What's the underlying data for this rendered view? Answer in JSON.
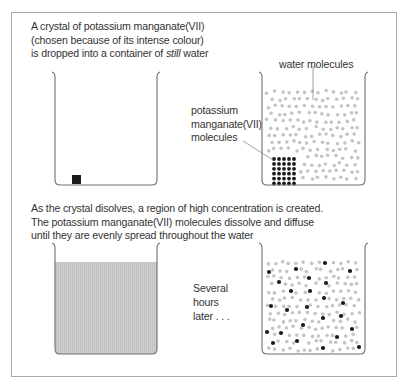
{
  "caption_top": {
    "line1": "A crystal of potassium manganate(VII)",
    "line2": "(chosen because of its intense colour)",
    "line3_pre": "is dropped into a container of ",
    "line3_em": "still",
    "line3_post": " water"
  },
  "labels": {
    "water_molecules": "water molecules",
    "kmno4_line1": "potassium",
    "kmno4_line2": "manganate(VII)",
    "kmno4_line3": "molecules"
  },
  "caption_bottom": {
    "line1": "As the crystal disolves, a region of high concentration is created.",
    "line2": "The potassium manganate(VII) molecules dissolve and diffuse",
    "line3": "until they are evenly spread throughout the water"
  },
  "time_note": {
    "line1": "Several",
    "line2": "hours",
    "line3": "later . . ."
  },
  "colors": {
    "frame": "#a8a8a8",
    "beaker": "#6e6e6e",
    "water_molecule": "#c4c4c4",
    "kmno4_molecule": "#1a1a1a",
    "dissolved_fill": "#c9c9c9"
  },
  "diffused_kmno4_positions": [
    [
      269,
      272
    ],
    [
      296,
      269
    ],
    [
      325,
      263
    ],
    [
      350,
      271
    ],
    [
      279,
      282
    ],
    [
      309,
      278
    ],
    [
      326,
      283
    ],
    [
      291,
      291
    ],
    [
      310,
      291
    ],
    [
      324,
      298
    ],
    [
      343,
      303
    ],
    [
      271,
      306
    ],
    [
      287,
      310
    ],
    [
      307,
      307
    ],
    [
      323,
      318
    ],
    [
      341,
      316
    ],
    [
      303,
      325
    ],
    [
      352,
      329
    ],
    [
      267,
      332
    ],
    [
      281,
      333
    ],
    [
      337,
      337
    ],
    [
      297,
      341
    ],
    [
      273,
      343
    ],
    [
      323,
      348
    ],
    [
      359,
      347
    ]
  ]
}
